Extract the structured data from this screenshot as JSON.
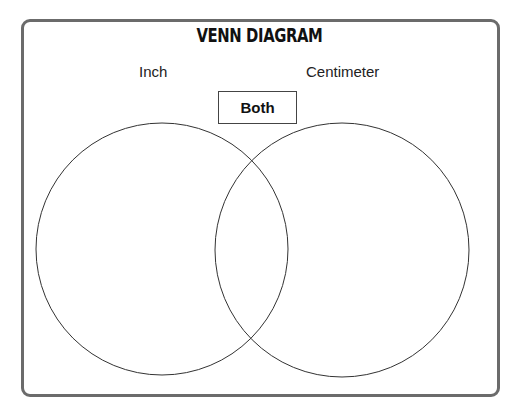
{
  "title": "VENN DIAGRAM",
  "sets": [
    {
      "label": "Inch",
      "cx": 162,
      "cy": 249,
      "r": 126
    },
    {
      "label": "Centimeter",
      "cx": 342,
      "cy": 250,
      "r": 127
    }
  ],
  "intersection_label": "Both",
  "colors": {
    "frame": "#6b6b6b",
    "stroke": "#333333"
  }
}
